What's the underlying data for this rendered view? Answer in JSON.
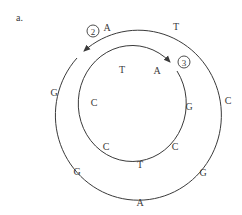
{
  "panel_label": "a.",
  "outer_strand": {
    "marker": "2",
    "bases": [
      {
        "base": "A",
        "x": 107,
        "y": 31
      },
      {
        "base": "T",
        "x": 176,
        "y": 30
      },
      {
        "base": "C",
        "x": 228,
        "y": 104
      },
      {
        "base": "G",
        "x": 203,
        "y": 176
      },
      {
        "base": "A",
        "x": 140,
        "y": 206
      },
      {
        "base": "G",
        "x": 77,
        "y": 175
      },
      {
        "base": "G",
        "x": 54,
        "y": 96
      }
    ]
  },
  "inner_strand": {
    "marker": "3",
    "bases": [
      {
        "base": "T",
        "x": 122,
        "y": 73
      },
      {
        "base": "A",
        "x": 157,
        "y": 74
      },
      {
        "base": "G",
        "x": 189,
        "y": 110
      },
      {
        "base": "C",
        "x": 175,
        "y": 150
      },
      {
        "base": "T",
        "x": 140,
        "y": 168
      },
      {
        "base": "C",
        "x": 106,
        "y": 150
      },
      {
        "base": "C",
        "x": 94,
        "y": 106
      }
    ]
  },
  "colors": {
    "stroke": "#3a3a3a",
    "text": "#3a3a3a",
    "background": "#ffffff"
  }
}
